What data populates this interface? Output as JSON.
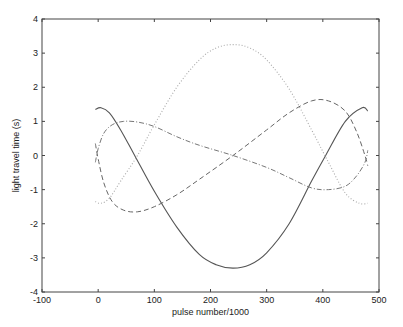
{
  "chart_data": {
    "type": "line",
    "title": "",
    "xlabel": "pulse number/1000",
    "ylabel": "light travel time (s)",
    "xlim": [
      -100,
      500
    ],
    "ylim": [
      -4,
      4
    ],
    "xticks": [
      -100,
      0,
      100,
      200,
      300,
      400,
      500
    ],
    "yticks": [
      -4,
      -3,
      -2,
      -1,
      0,
      1,
      2,
      3,
      4
    ],
    "grid": false,
    "legend": null,
    "series": [
      {
        "name": "solid",
        "style": "solid",
        "x": [
          -5,
          5,
          20,
          40,
          65,
          100,
          140,
          180,
          210,
          240,
          270,
          300,
          340,
          380,
          405,
          440,
          470,
          480
        ],
        "y": [
          1.35,
          1.4,
          1.25,
          0.75,
          0.0,
          -1.05,
          -2.1,
          -2.9,
          -3.2,
          -3.3,
          -3.2,
          -2.85,
          -2.0,
          -0.75,
          0.0,
          1.0,
          1.4,
          1.3
        ]
      },
      {
        "name": "dotted",
        "style": "dotted",
        "x": [
          -5,
          5,
          20,
          40,
          70,
          100,
          140,
          180,
          210,
          240,
          270,
          300,
          340,
          380,
          410,
          440,
          465,
          480
        ],
        "y": [
          -1.35,
          -1.4,
          -1.25,
          -0.75,
          0.0,
          0.9,
          2.0,
          2.8,
          3.15,
          3.25,
          3.15,
          2.8,
          1.95,
          0.75,
          -0.2,
          -1.1,
          -1.4,
          -1.4
        ]
      },
      {
        "name": "dashed",
        "style": "dashed",
        "x": [
          -5,
          0,
          10,
          25,
          45,
          70,
          100,
          140,
          180,
          240,
          300,
          340,
          380,
          410,
          440,
          460,
          475,
          480
        ],
        "y": [
          0.35,
          -0.1,
          -0.8,
          -1.35,
          -1.6,
          -1.65,
          -1.5,
          -1.15,
          -0.7,
          0.0,
          0.75,
          1.25,
          1.6,
          1.6,
          1.3,
          0.7,
          0.0,
          -0.3
        ]
      },
      {
        "name": "dash-dot",
        "style": "dashdot",
        "x": [
          -5,
          0,
          10,
          25,
          45,
          70,
          100,
          140,
          180,
          240,
          300,
          340,
          380,
          410,
          440,
          460,
          475,
          480
        ],
        "y": [
          -0.2,
          0.2,
          0.65,
          0.9,
          1.0,
          0.98,
          0.85,
          0.55,
          0.3,
          0.0,
          -0.35,
          -0.65,
          -0.95,
          -1.0,
          -0.9,
          -0.6,
          -0.2,
          0.15
        ]
      }
    ]
  }
}
